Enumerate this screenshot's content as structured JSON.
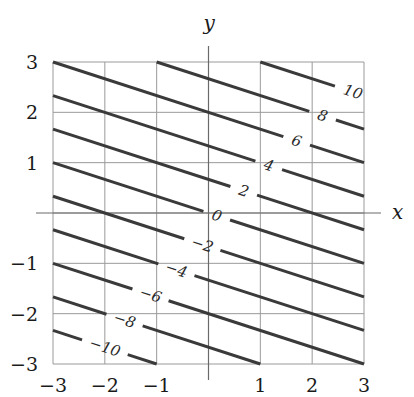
{
  "chart_data": {
    "type": "contour",
    "function": "f(x, y) = x + 3y",
    "title": "",
    "xlabel": "x",
    "ylabel": "y",
    "xlim": [
      -3,
      3
    ],
    "ylim": [
      -3,
      3
    ],
    "grid": true,
    "x_ticks": [
      -3,
      -2,
      -1,
      1,
      2,
      3
    ],
    "y_ticks": [
      -3,
      -2,
      -1,
      1,
      2,
      3
    ],
    "x_tick_labels": [
      "−3",
      "−2",
      "−1",
      "1",
      "2",
      "3"
    ],
    "y_tick_labels": [
      "−3",
      "−2",
      "−1",
      "1",
      "2",
      "3"
    ],
    "levels": [
      -10,
      -8,
      -6,
      -4,
      -2,
      0,
      2,
      4,
      6,
      8,
      10
    ],
    "level_labels": [
      "−10",
      "−8",
      "−6",
      "−4",
      "−2",
      "0",
      "2",
      "4",
      "6",
      "8",
      "10"
    ],
    "label_positions": [
      {
        "level": -10,
        "x": -2.0,
        "y": -2.67
      },
      {
        "level": -8,
        "x": -1.62,
        "y": -2.13
      },
      {
        "level": -6,
        "x": -1.12,
        "y": -1.63
      },
      {
        "level": -4,
        "x": -0.62,
        "y": -1.13
      },
      {
        "level": -2,
        "x": -0.12,
        "y": -0.63
      },
      {
        "level": 0,
        "x": 0.16,
        "y": -0.05
      },
      {
        "level": 2,
        "x": 0.68,
        "y": 0.44
      },
      {
        "level": 4,
        "x": 1.16,
        "y": 0.94
      },
      {
        "level": 6,
        "x": 1.7,
        "y": 1.43
      },
      {
        "level": 8,
        "x": 2.2,
        "y": 1.93
      },
      {
        "level": 10,
        "x": 2.78,
        "y": 2.38
      }
    ],
    "colors": {
      "contour": "#3a3a3a",
      "grid": "#9a9a9a",
      "axis": "#6a6a6a"
    }
  }
}
